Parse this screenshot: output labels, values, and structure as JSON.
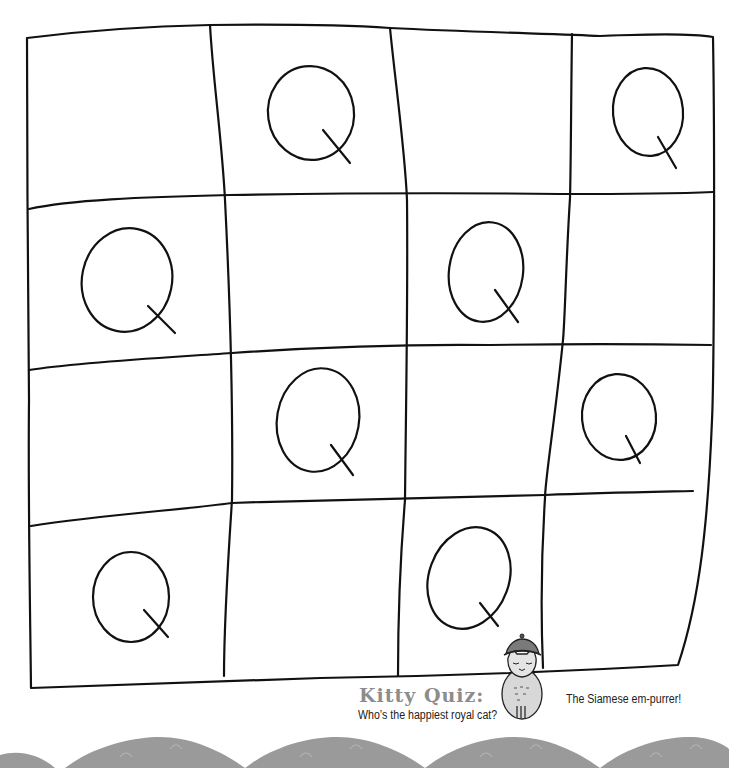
{
  "puzzle": {
    "type": "hand-drawn 4x4 grid",
    "rows": 4,
    "cols": 4,
    "cells": [
      [
        "",
        "Q",
        "",
        "Q"
      ],
      [
        "Q",
        "",
        "Q",
        ""
      ],
      [
        "",
        "Q",
        "",
        "Q"
      ],
      [
        "Q",
        "",
        "Q",
        ""
      ]
    ],
    "line_color": "#111111"
  },
  "kitty_quiz": {
    "title": "Kitty Quiz:",
    "question": "Who’s the happiest royal cat?",
    "answer": "The Siamese em-purrer!"
  },
  "footer": {
    "decoration": "gray wave border",
    "color": "#9a9a9a"
  }
}
